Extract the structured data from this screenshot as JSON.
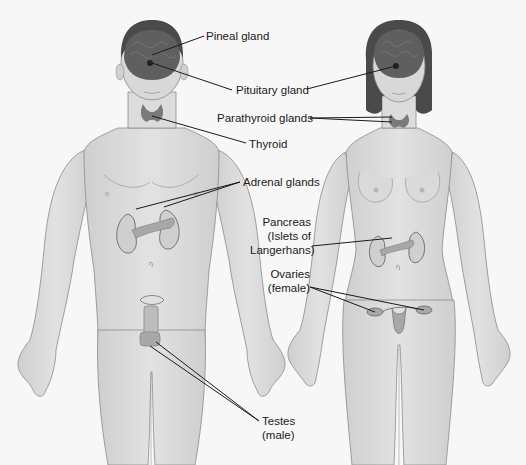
{
  "diagram": {
    "figures": [
      {
        "id": "male",
        "name": "Male figure"
      },
      {
        "id": "female",
        "name": "Female figure"
      }
    ],
    "labels": {
      "pineal": "Pineal gland",
      "pituitary": "Pituitary gland",
      "parathyroid": "Parathyroid glands",
      "thyroid": "Thyroid",
      "adrenal": "Adrenal glands",
      "pancreas_line1": "Pancreas",
      "pancreas_line2": "(Islets of",
      "pancreas_line3": "Langerhans)",
      "ovaries_line1": "Ovaries",
      "ovaries_line2": "(female)",
      "testes_line1": "Testes",
      "testes_line2": "(male)"
    },
    "colors": {
      "background": "#f7f7f7",
      "skin": "#d6d6d6",
      "skin_outline": "#8a8a8a",
      "hair": "#4a4a4a",
      "brain": "#5f5f5f",
      "gland": "#7a7a7a",
      "callout": "#1a1a1a"
    }
  }
}
